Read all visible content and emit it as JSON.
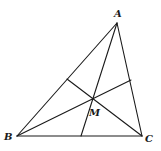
{
  "diagram": {
    "type": "triangle-cevians",
    "points": {
      "A": {
        "x": 117,
        "y": 23
      },
      "B": {
        "x": 17,
        "y": 136
      },
      "C": {
        "x": 142,
        "y": 136
      },
      "M": {
        "x": 93,
        "y": 99
      },
      "P_AB": {
        "x": 67,
        "y": 79
      },
      "P_AC": {
        "x": 131,
        "y": 80
      },
      "P_BC": {
        "x": 81,
        "y": 136
      }
    },
    "labels": {
      "A": "A",
      "B": "B",
      "C": "C",
      "M": "M"
    },
    "label_positions": {
      "A": {
        "x": 114,
        "y": 17
      },
      "B": {
        "x": 4,
        "y": 140
      },
      "C": {
        "x": 145,
        "y": 142
      },
      "M": {
        "x": 89,
        "y": 116
      }
    },
    "segments": [
      {
        "name": "side-ab",
        "from": "A",
        "to": "B"
      },
      {
        "name": "side-bc",
        "from": "B",
        "to": "C"
      },
      {
        "name": "side-ca",
        "from": "C",
        "to": "A"
      },
      {
        "name": "cevian-a",
        "from": "A",
        "to": "P_BC"
      },
      {
        "name": "cevian-b",
        "from": "B",
        "to": "P_AC"
      },
      {
        "name": "cevian-c",
        "from": "C",
        "to": "P_AB"
      }
    ],
    "colors": {
      "stroke": "#1a1a1a",
      "background": "#ffffff"
    }
  }
}
